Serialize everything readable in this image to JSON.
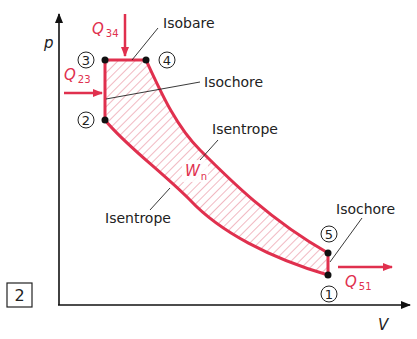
{
  "figure": {
    "number": "2",
    "axes": {
      "y_label": "p",
      "x_label": "V"
    },
    "points": [
      {
        "id": "1",
        "label": "1"
      },
      {
        "id": "2",
        "label": "2"
      },
      {
        "id": "3",
        "label": "3"
      },
      {
        "id": "4",
        "label": "4"
      },
      {
        "id": "5",
        "label": "5"
      }
    ],
    "processes": {
      "isobare": "Isobare",
      "isochore_23": "Isochore",
      "isentrope_45": "Isentrope",
      "isentrope_12": "Isentrope",
      "isochore_51": "Isochore"
    },
    "heat": {
      "q34": {
        "main": "Q",
        "sub": "34"
      },
      "q23": {
        "main": "Q",
        "sub": "23"
      },
      "q51": {
        "main": "Q",
        "sub": "51"
      }
    },
    "work": {
      "main": "W",
      "sub": "n"
    },
    "colors": {
      "cycle": "#e0304e",
      "hatch": "#e88a98",
      "ink": "#222222"
    }
  }
}
